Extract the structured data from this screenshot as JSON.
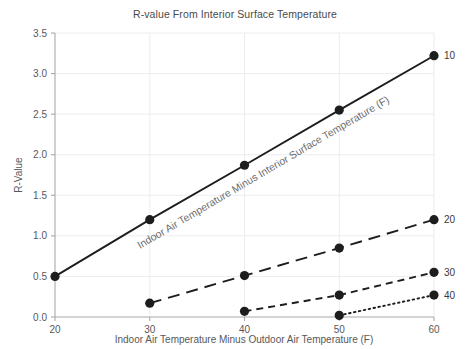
{
  "chart_data": {
    "type": "line",
    "title": "R-value From Interior Surface Temperature",
    "xlabel": "Indoor Air Temperature Minus Outdoor Air Temperature (F)",
    "ylabel": "R-Value",
    "annotation": "Indoor Air Temperature Minus Interior Surface Temperature (F)",
    "xlim": [
      20,
      60
    ],
    "ylim": [
      0.0,
      3.5
    ],
    "xticks": [
      20,
      30,
      40,
      50,
      60
    ],
    "xtick_labels": [
      "20",
      "30",
      "40",
      "50",
      "60"
    ],
    "yticks": [
      0.0,
      0.5,
      1.0,
      1.5,
      2.0,
      2.5,
      3.0,
      3.5
    ],
    "ytick_labels": [
      "0.0",
      "0.5",
      "1.0",
      "1.5",
      "2.0",
      "2.5",
      "3.0",
      "3.5"
    ],
    "grid": true,
    "legend_position": "right-end-labels",
    "markers": true,
    "series": [
      {
        "name": "10",
        "label": "10",
        "dash": "solid",
        "color": "#1d1d1d",
        "x": [
          20,
          30,
          40,
          50,
          60
        ],
        "values": [
          0.5,
          1.2,
          1.87,
          2.55,
          3.22
        ]
      },
      {
        "name": "20",
        "label": "20",
        "dash": "long-dash",
        "color": "#1d1d1d",
        "x": [
          30,
          40,
          50,
          60
        ],
        "values": [
          0.17,
          0.51,
          0.85,
          1.2
        ]
      },
      {
        "name": "30",
        "label": "30",
        "dash": "short-dash",
        "color": "#1d1d1d",
        "x": [
          40,
          50,
          60
        ],
        "values": [
          0.07,
          0.27,
          0.55
        ]
      },
      {
        "name": "40",
        "label": "40",
        "dash": "dotted",
        "color": "#1d1d1d",
        "x": [
          50,
          60
        ],
        "values": [
          0.02,
          0.27
        ]
      }
    ]
  },
  "colors": {
    "background": "#ffffff",
    "grid": "#ececf0",
    "axis": "#a9a9ad",
    "line": "#1d1d1d",
    "text": "#58585a",
    "annotation": "#6b6b6b"
  }
}
